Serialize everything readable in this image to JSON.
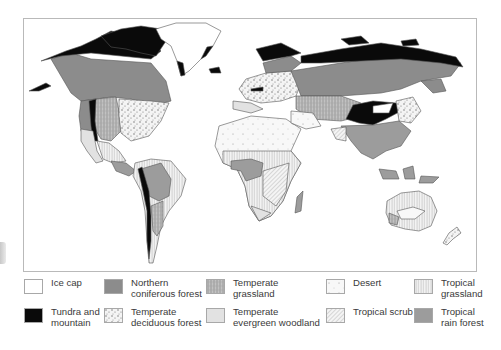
{
  "map": {
    "title": "World biomes",
    "colors": {
      "ice_cap": "#ffffff",
      "tundra_mountain": "#0a0a0a",
      "northern_coniferous_forest": "#8c8c8c",
      "temperate_deciduous_forest": "#f2f2f2",
      "temperate_grassland": "#b5b5b5",
      "temperate_evergreen_woodland": "#e2e2e2",
      "desert": "#f7f7f7",
      "tropical_scrub": "#e8e8e8",
      "tropical_grassland": "#f0f0f0",
      "tropical_rain_forest": "#9c9c9c",
      "outline": "#555555",
      "frame": "#b9b9b9"
    }
  },
  "legend": {
    "items": [
      {
        "key": "ice_cap",
        "label": "Ice cap"
      },
      {
        "key": "northern_coniferous_forest",
        "label": "Northern\nconiferous forest"
      },
      {
        "key": "temperate_grassland",
        "label": "Temperate\ngrassland"
      },
      {
        "key": "desert",
        "label": "Desert"
      },
      {
        "key": "tropical_grassland",
        "label": "Tropical\ngrassland"
      },
      {
        "key": "tundra_mountain",
        "label": "Tundra and\nmountain"
      },
      {
        "key": "temperate_deciduous_forest",
        "label": "Temperate\ndeciduous forest"
      },
      {
        "key": "temperate_evergreen_woodland",
        "label": "Temperate\nevergreen woodland"
      },
      {
        "key": "tropical_scrub",
        "label": "Tropical scrub"
      },
      {
        "key": "tropical_rain_forest",
        "label": "Tropical\nrain forest"
      }
    ]
  }
}
